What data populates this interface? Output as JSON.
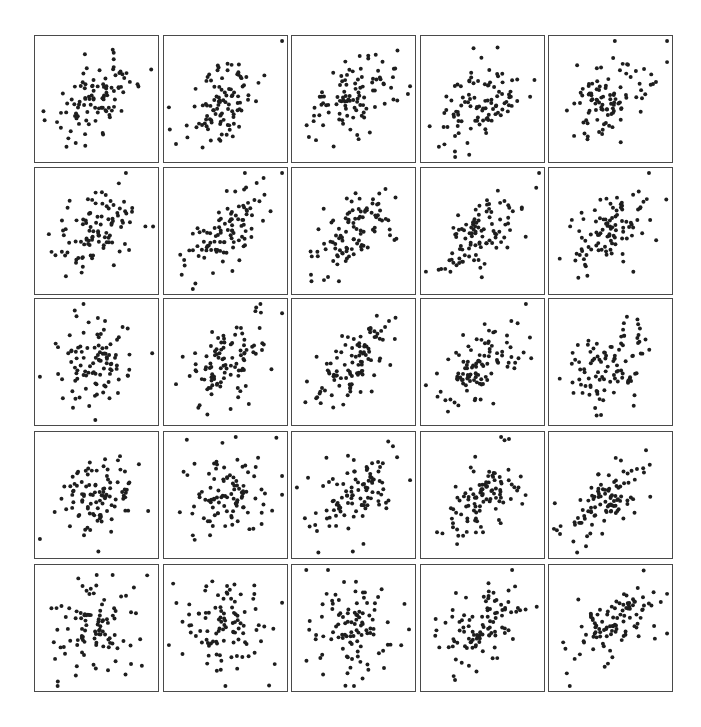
{
  "chart_data": {
    "type": "scatter",
    "title": "",
    "layout": "5x5 grid of scatter plots (small multiples)",
    "axes": "no tick labels, no axis labels, no grid; each panel framed by a box",
    "points_per_panel": 100,
    "marker": {
      "shape": "circle",
      "diameter_px": 4,
      "color": "#1e1e1e"
    },
    "frame_color": "#4a4a4a",
    "panels": [
      {
        "row": 1,
        "col": 1,
        "correlation": 0.6
      },
      {
        "row": 1,
        "col": 2,
        "correlation": 0.55
      },
      {
        "row": 1,
        "col": 3,
        "correlation": 0.4
      },
      {
        "row": 1,
        "col": 4,
        "correlation": 0.35
      },
      {
        "row": 1,
        "col": 5,
        "correlation": 0.4
      },
      {
        "row": 2,
        "col": 1,
        "correlation": 0.4
      },
      {
        "row": 2,
        "col": 2,
        "correlation": 0.55
      },
      {
        "row": 2,
        "col": 3,
        "correlation": 0.65
      },
      {
        "row": 2,
        "col": 4,
        "correlation": 0.55
      },
      {
        "row": 2,
        "col": 5,
        "correlation": 0.5
      },
      {
        "row": 3,
        "col": 1,
        "correlation": 0.05
      },
      {
        "row": 3,
        "col": 2,
        "correlation": 0.55
      },
      {
        "row": 3,
        "col": 3,
        "correlation": 0.6
      },
      {
        "row": 3,
        "col": 4,
        "correlation": 0.65
      },
      {
        "row": 3,
        "col": 5,
        "correlation": 0.35
      },
      {
        "row": 4,
        "col": 1,
        "correlation": 0.15
      },
      {
        "row": 4,
        "col": 2,
        "correlation": 0.1
      },
      {
        "row": 4,
        "col": 3,
        "correlation": 0.45
      },
      {
        "row": 4,
        "col": 4,
        "correlation": 0.5
      },
      {
        "row": 4,
        "col": 5,
        "correlation": 0.6
      },
      {
        "row": 5,
        "col": 1,
        "correlation": 0.1
      },
      {
        "row": 5,
        "col": 2,
        "correlation": 0.1
      },
      {
        "row": 5,
        "col": 3,
        "correlation": 0.0
      },
      {
        "row": 5,
        "col": 4,
        "correlation": 0.45
      },
      {
        "row": 5,
        "col": 5,
        "correlation": 0.6
      }
    ],
    "grid_geometry": {
      "col_x": [
        34,
        163,
        291,
        420,
        548
      ],
      "row_y": [
        35,
        167,
        298,
        431,
        564
      ],
      "panel_width": 125,
      "panel_height": 128
    }
  }
}
